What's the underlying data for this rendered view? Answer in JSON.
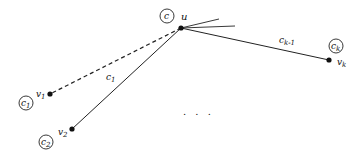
{
  "diagram": {
    "center_node": {
      "label": "u",
      "color_label": "c"
    },
    "nodes": [
      {
        "id": "v1",
        "label": "v",
        "sub": "1",
        "color_label": "c",
        "color_sub": "1"
      },
      {
        "id": "v2",
        "label": "v",
        "sub": "2",
        "color_label": "c",
        "color_sub": "2"
      },
      {
        "id": "vk",
        "label": "v",
        "sub": "k",
        "color_label": "c",
        "color_sub": "k"
      }
    ],
    "edges": [
      {
        "from": "u",
        "to": "v1",
        "style": "dashed",
        "label": ""
      },
      {
        "from": "u",
        "to": "v2",
        "style": "solid",
        "label": "c",
        "label_sub": "1"
      },
      {
        "from": "u",
        "to": "vk",
        "style": "solid",
        "label": "c",
        "label_sub": "k-1"
      }
    ],
    "ellipsis": ". . ."
  }
}
